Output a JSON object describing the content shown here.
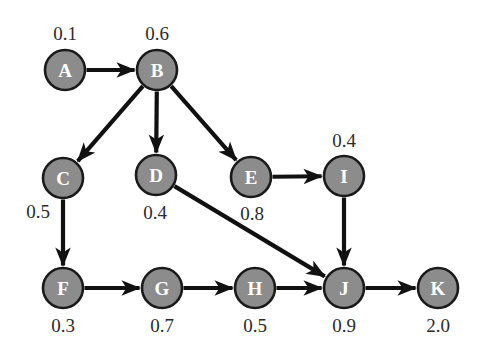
{
  "figure": {
    "name": "directed-acyclic-graph",
    "background_color": "#ffffff",
    "node_fill_color": "#8c8c8c",
    "node_stroke_color": "#1a1a1a",
    "node_label_color": "#ffffff",
    "edge_color": "#111111",
    "value_text_color": "#2b2b2b",
    "node_radius": 20
  },
  "chart_data": {
    "type": "diagram",
    "title": "",
    "nodes": [
      {
        "id": "A",
        "label": "A",
        "value": "0.1",
        "cx": 65,
        "cy": 70,
        "value_x": 65,
        "value_y": 33
      },
      {
        "id": "B",
        "label": "B",
        "value": "0.6",
        "cx": 157,
        "cy": 70,
        "value_x": 157,
        "value_y": 33
      },
      {
        "id": "C",
        "label": "C",
        "value": "0.5",
        "cx": 63,
        "cy": 178,
        "value_x": 38,
        "value_y": 211
      },
      {
        "id": "D",
        "label": "D",
        "value": "0.4",
        "cx": 156,
        "cy": 175,
        "value_x": 155,
        "value_y": 212
      },
      {
        "id": "E",
        "label": "E",
        "value": "0.8",
        "cx": 251,
        "cy": 177,
        "value_x": 252,
        "value_y": 213
      },
      {
        "id": "I",
        "label": "I",
        "value": "0.4",
        "cx": 344,
        "cy": 176,
        "value_x": 344,
        "value_y": 140
      },
      {
        "id": "F",
        "label": "F",
        "value": "0.3",
        "cx": 63,
        "cy": 288,
        "value_x": 63,
        "value_y": 325
      },
      {
        "id": "G",
        "label": "G",
        "value": "0.7",
        "cx": 162,
        "cy": 288,
        "value_x": 162,
        "value_y": 325
      },
      {
        "id": "H",
        "label": "H",
        "value": "0.5",
        "cx": 255,
        "cy": 288,
        "value_x": 255,
        "value_y": 325
      },
      {
        "id": "J",
        "label": "J",
        "value": "0.9",
        "cx": 344,
        "cy": 288,
        "value_x": 344,
        "value_y": 325
      },
      {
        "id": "K",
        "label": "K",
        "value": "2.0",
        "cx": 438,
        "cy": 288,
        "value_x": 438,
        "value_y": 325
      }
    ],
    "edges": [
      {
        "from": "A",
        "to": "B"
      },
      {
        "from": "B",
        "to": "C"
      },
      {
        "from": "B",
        "to": "D"
      },
      {
        "from": "B",
        "to": "E"
      },
      {
        "from": "C",
        "to": "F"
      },
      {
        "from": "D",
        "to": "J"
      },
      {
        "from": "E",
        "to": "I"
      },
      {
        "from": "I",
        "to": "J"
      },
      {
        "from": "F",
        "to": "G"
      },
      {
        "from": "G",
        "to": "H"
      },
      {
        "from": "H",
        "to": "J"
      },
      {
        "from": "J",
        "to": "K"
      }
    ]
  }
}
